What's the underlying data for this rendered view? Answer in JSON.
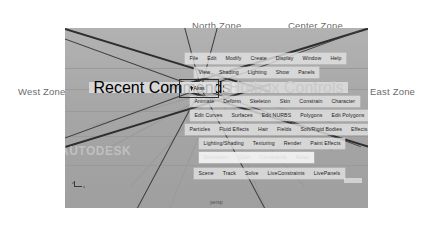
{
  "annotations": {
    "north": "North Zone",
    "center": "Center Zone",
    "west": "West Zone",
    "east": "East Zone"
  },
  "viewport": {
    "panel_label": "persp",
    "watermark": "AUTODESK",
    "axis_label_x": "x",
    "axis_label_z": "z",
    "background_color": "#a9a9a9",
    "divider_color": "#2e2e2e"
  },
  "hotbox": {
    "center_badge": "Alias",
    "rows": [
      {
        "name": "main-menu-row",
        "left": 55,
        "top": 25,
        "align": "center",
        "items": [
          "File",
          "Edit",
          "Modify",
          "Create",
          "Display",
          "Window",
          "Help"
        ]
      },
      {
        "name": "panel-menu-row",
        "left": 77,
        "top": 39,
        "align": "center",
        "items": [
          "View",
          "Shading",
          "Lighting",
          "Show",
          "Panels"
        ]
      },
      {
        "name": "animation-menu-row",
        "left": 60,
        "top": 68,
        "align": "center",
        "items": [
          "Animate",
          "Deform",
          "Skeleton",
          "Skin",
          "Constrain",
          "Character"
        ]
      },
      {
        "name": "modeling-menu-row",
        "left": 35,
        "top": 82,
        "align": "center",
        "items": [
          "Edit Curves",
          "Surfaces",
          "Edit NURBS",
          "Polygons",
          "Edit Polygons",
          "Subdiv Surfaces"
        ]
      },
      {
        "name": "dynamics-menu-row",
        "left": 35,
        "top": 96,
        "align": "center",
        "items": [
          "Particles",
          "Fluid Effects",
          "Hair",
          "Fields",
          "Soft/Rigid Bodies",
          "Effects",
          "Solvers"
        ]
      },
      {
        "name": "rendering-menu-row",
        "left": 58,
        "top": 110,
        "align": "center",
        "items": [
          "Lighting/Shading",
          "Texturing",
          "Render",
          "Paint Effects"
        ]
      },
      {
        "name": "cloth-menu-row",
        "left": 90,
        "top": 124,
        "align": "center",
        "highlight": true,
        "items": [
          "Simulation",
          "Cloth",
          "Constraints",
          "Relax"
        ]
      },
      {
        "name": "live-menu-row",
        "left": 58,
        "top": 140,
        "align": "center",
        "items": [
          "Scene",
          "Track",
          "Solve",
          "LiveConstraints",
          "LivePanels"
        ]
      }
    ],
    "recent_commands": "Recent Commands",
    "hotbox_controls": "Hotbox Controls"
  }
}
